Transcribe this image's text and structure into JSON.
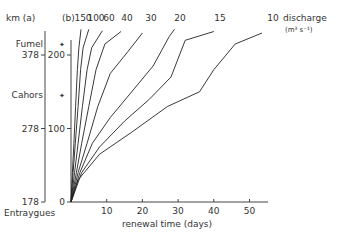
{
  "chart_data": {
    "type": "line",
    "title": "",
    "xlabel": "renewal time (days)",
    "ylabel_a": "km (a)",
    "ylabel_b": "(b)",
    "legend_title": "discharge",
    "legend_units": "(m³ s⁻¹)",
    "xlim": [
      0,
      55
    ],
    "ylim": [
      0,
      230
    ],
    "x_ticks": [
      10,
      20,
      30,
      40,
      50
    ],
    "y_ticks_b": [
      0,
      100,
      200
    ],
    "y_ticks_a": [
      {
        "label": "178",
        "value_b": 0
      },
      {
        "label": "278",
        "value_b": 100
      },
      {
        "label": "378",
        "value_b": 200
      }
    ],
    "places": [
      {
        "name": "Fumel",
        "value_b": 215,
        "marker": true
      },
      {
        "name": "Cahors",
        "value_b": 145,
        "marker": true
      },
      {
        "name": "Entraygues",
        "value_b": -15,
        "marker": false
      }
    ],
    "series": [
      {
        "name": "150",
        "x": [
          0,
          0.4,
          0.8,
          1.3,
          1.8,
          2.2,
          2.8
        ],
        "y": [
          0,
          40,
          80,
          130,
          180,
          210,
          235
        ]
      },
      {
        "name": "100",
        "x": [
          0,
          0.6,
          1.2,
          2.0,
          2.7,
          3.4,
          5.0
        ],
        "y": [
          0,
          40,
          80,
          130,
          180,
          210,
          235
        ]
      },
      {
        "name": "60",
        "x": [
          0,
          1.0,
          2.0,
          3.2,
          4.5,
          5.8,
          8.8
        ],
        "y": [
          0,
          40,
          80,
          130,
          180,
          210,
          233
        ]
      },
      {
        "name": "40",
        "x": [
          0,
          1.5,
          3.0,
          5.0,
          7.0,
          9.5,
          14
        ],
        "y": [
          0,
          40,
          80,
          130,
          180,
          215,
          232
        ]
      },
      {
        "name": "30",
        "x": [
          0,
          2.0,
          4.5,
          7.5,
          11,
          16,
          20
        ],
        "y": [
          0,
          40,
          80,
          130,
          175,
          205,
          230
        ]
      },
      {
        "name": "20",
        "x": [
          0,
          2.5,
          6.0,
          11,
          17,
          23,
          27.5,
          29
        ],
        "y": [
          0,
          40,
          80,
          115,
          150,
          185,
          225,
          235
        ]
      },
      {
        "name": "15",
        "x": [
          0,
          3.0,
          8.0,
          15,
          22,
          28,
          32,
          40
        ],
        "y": [
          0,
          40,
          75,
          110,
          140,
          170,
          220,
          232
        ]
      },
      {
        "name": "10",
        "x": [
          0,
          2.0,
          8.0,
          17,
          27,
          36,
          40,
          46,
          53.5
        ],
        "y": [
          0,
          30,
          65,
          95,
          130,
          150,
          180,
          215,
          230
        ]
      }
    ]
  }
}
